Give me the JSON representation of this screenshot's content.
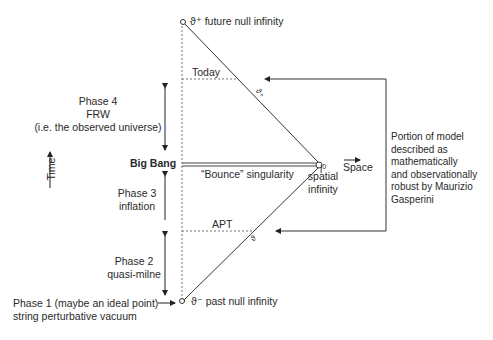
{
  "diagram": {
    "type": "penrose-like conformal diagram (pre-big-bang cosmology)",
    "points": {
      "future_null_infinity": "ϑ⁺ future null infinity",
      "past_null_infinity": "ϑ⁻ past null infinity",
      "spatial_infinity_symbol": "i",
      "spatial_infinity_sup": "0",
      "spatial_infinity_label": [
        "spatial",
        "infinity"
      ]
    },
    "horizontal_markers": {
      "today": "Today",
      "apt": "APT",
      "bounce": "“Bounce” singularity"
    },
    "edge_labels": {
      "upper": "ϑ₊",
      "lower": "ϑ"
    },
    "axes": {
      "time": "Time",
      "space": "Space"
    },
    "phases": [
      {
        "lines": [
          "Phase 4",
          "FRW",
          "(i.e. the observed universe)"
        ]
      },
      {
        "lines": [
          "Big Bang"
        ]
      },
      {
        "lines": [
          "Phase 3",
          "inflation"
        ]
      },
      {
        "lines": [
          "Phase 2",
          "quasi-milne"
        ]
      },
      {
        "lines": [
          "Phase 1 (maybe an ideal point)",
          "string perturbative vacuum"
        ]
      }
    ],
    "bracket_note": [
      "Portion of model",
      "described as",
      "mathematically",
      "and observationally",
      "robust by Maurizio",
      "Gasperini"
    ]
  }
}
